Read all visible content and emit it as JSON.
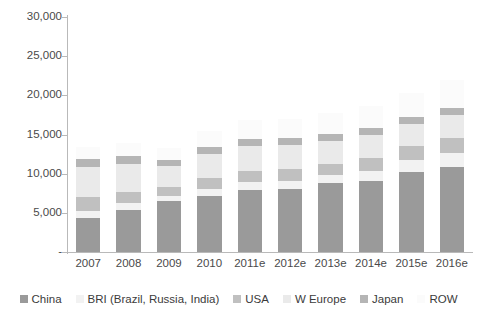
{
  "chart_data": {
    "type": "bar",
    "stacked": true,
    "title": "",
    "xlabel": "",
    "ylabel": "",
    "ylim": [
      0,
      30000
    ],
    "ytick_step": 5000,
    "ytick_labels": [
      "-",
      "5,000",
      "10,000",
      "15,000",
      "20,000",
      "25,000",
      "30,000"
    ],
    "ytick_values": [
      0,
      5000,
      10000,
      15000,
      20000,
      25000,
      30000
    ],
    "grid": false,
    "legend_position": "bottom",
    "categories": [
      "2007",
      "2008",
      "2009",
      "2010",
      "2011e",
      "2012e",
      "2013e",
      "2014e",
      "2015e",
      "2016e"
    ],
    "series": [
      {
        "name": "China",
        "color": "#9a9a9a",
        "values": [
          4300,
          5300,
          6500,
          7200,
          7900,
          8100,
          8800,
          9100,
          10200,
          10800
        ]
      },
      {
        "name": "BRI (Brazil, Russia, India)",
        "color": "#f2f2f2",
        "values": [
          900,
          900,
          700,
          900,
          1000,
          1000,
          1000,
          1300,
          1600,
          1900
        ]
      },
      {
        "name": "USA",
        "color": "#c0c0c0",
        "values": [
          1800,
          1500,
          1100,
          1300,
          1400,
          1500,
          1500,
          1600,
          1700,
          1800
        ]
      },
      {
        "name": "W Europe",
        "color": "#eaeaea",
        "values": [
          3900,
          3600,
          2700,
          3100,
          3200,
          3100,
          2900,
          2900,
          2900,
          3000
        ]
      },
      {
        "name": "Japan",
        "color": "#b5b5b5",
        "values": [
          1000,
          900,
          800,
          900,
          900,
          900,
          900,
          900,
          900,
          900
        ]
      },
      {
        "name": "ROW",
        "color": "#fbfbfb",
        "values": [
          1500,
          1700,
          1500,
          2100,
          2400,
          2400,
          2600,
          2900,
          3000,
          3600
        ]
      }
    ],
    "totals": [
      13400,
      13900,
      13300,
      15500,
      16800,
      17000,
      17700,
      18700,
      20300,
      22000
    ]
  },
  "legend": {
    "items": [
      {
        "label": "China"
      },
      {
        "label": "BRI (Brazil, Russia, India)"
      },
      {
        "label": "USA"
      },
      {
        "label": "W Europe"
      },
      {
        "label": "Japan"
      },
      {
        "label": "ROW"
      }
    ]
  }
}
